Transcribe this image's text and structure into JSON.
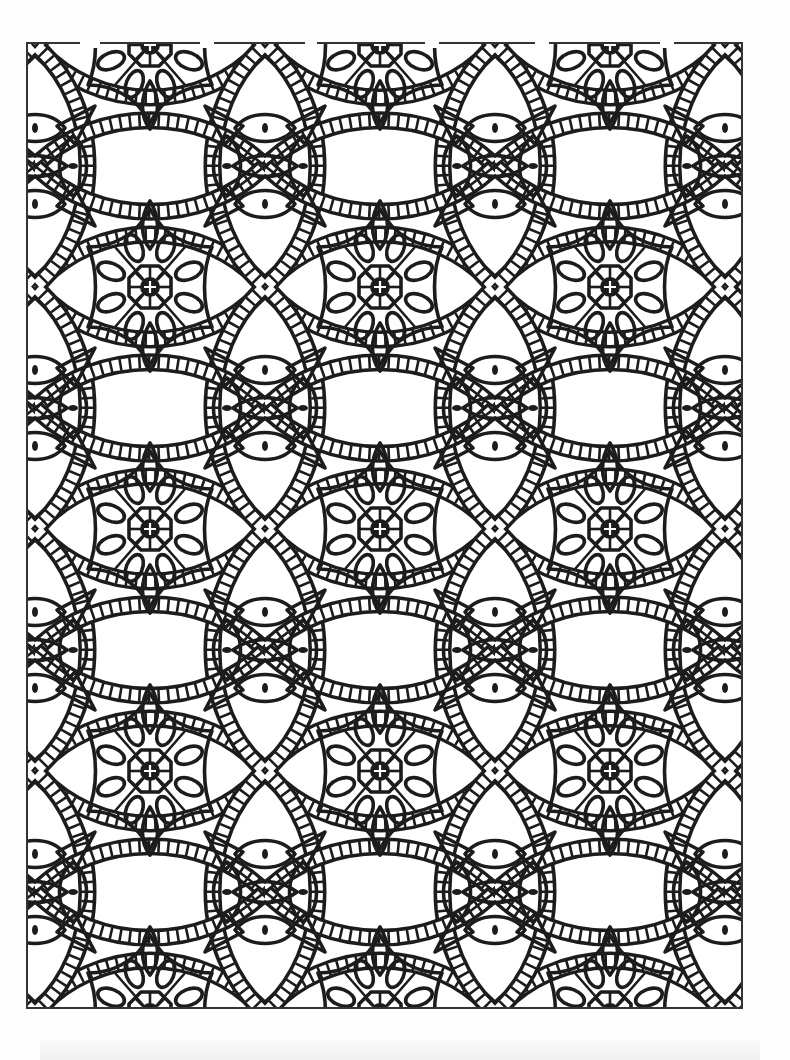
{
  "page": {
    "type": "coloring-page",
    "background_color": "#ffffff",
    "line_color": "#1c1c1c"
  },
  "frame": {
    "x": 27,
    "y": 43,
    "width": 715,
    "height": 965,
    "stroke": "#333333"
  },
  "pattern": {
    "tile_width": 230,
    "tile_height": 242,
    "origin_x": 35,
    "origin_y": 45,
    "motifs": [
      {
        "name": "flower-medallion",
        "parts": [
          "octagon-center",
          "plus-mark",
          "8-oval-petals",
          "4-lobed-outline"
        ]
      },
      {
        "name": "eye-cluster",
        "parts": [
          "4-eye-shapes",
          "center-dots",
          "star-rays"
        ]
      },
      {
        "name": "ladder-lattice-band",
        "parts": [
          "crossing-arcs",
          "square-cells"
        ]
      },
      {
        "name": "almond-leaf",
        "parts": [
          "pointed-oval"
        ]
      }
    ],
    "flower_centers": [
      [
        150,
        45
      ],
      [
        380,
        45
      ],
      [
        607,
        45
      ],
      [
        150,
        285
      ],
      [
        380,
        285
      ],
      [
        607,
        285
      ],
      [
        150,
        525
      ],
      [
        380,
        525
      ],
      [
        607,
        525
      ],
      [
        150,
        768
      ],
      [
        380,
        768
      ],
      [
        607,
        768
      ],
      [
        150,
        1008
      ],
      [
        380,
        1008
      ],
      [
        607,
        1008
      ]
    ],
    "eye_centers": [
      [
        37,
        165
      ],
      [
        265,
        165
      ],
      [
        495,
        165
      ],
      [
        725,
        165
      ],
      [
        37,
        405
      ],
      [
        265,
        405
      ],
      [
        495,
        405
      ],
      [
        725,
        405
      ],
      [
        37,
        645
      ],
      [
        265,
        645
      ],
      [
        495,
        645
      ],
      [
        725,
        645
      ],
      [
        37,
        888
      ],
      [
        265,
        888
      ],
      [
        495,
        888
      ],
      [
        725,
        888
      ]
    ]
  }
}
